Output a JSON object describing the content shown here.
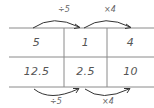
{
  "table": {
    "rows": [
      [
        "5",
        "1",
        "4"
      ],
      [
        "12.5",
        "2.5",
        "10"
      ]
    ]
  },
  "arrows": {
    "top": [
      {
        "label": "÷5",
        "from_col": 0,
        "to_col": 1
      },
      {
        "label": "×4",
        "from_col": 1,
        "to_col": 2
      }
    ],
    "bottom": [
      {
        "label": "÷5",
        "from_col": 0,
        "to_col": 1
      },
      {
        "label": "×4",
        "from_col": 1,
        "to_col": 2
      }
    ]
  },
  "colors": {
    "line": "#888888",
    "arrow": "#333333",
    "text": "#555555"
  }
}
